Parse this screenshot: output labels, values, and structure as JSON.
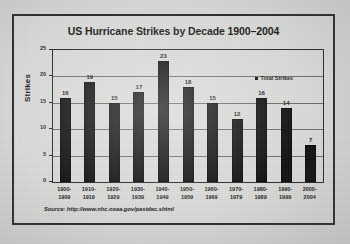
{
  "chart_data": {
    "type": "bar",
    "title": "US Hurricane Strikes by Decade 1900–2004",
    "xlabel": "",
    "ylabel": "Strikes",
    "ylim": [
      0,
      25
    ],
    "ytick_step": 5,
    "grid": true,
    "legend_position": "top-right",
    "legend": [
      "Total Strikes"
    ],
    "categories": [
      "1900–\n1909",
      "1910–\n1919",
      "1920–\n1929",
      "1930–\n1939",
      "1940–\n1949",
      "1950–\n1959",
      "1960–\n1969",
      "1970–\n1979",
      "1980–\n1989",
      "1990–\n1999",
      "2000–\n2004"
    ],
    "category_lines": [
      [
        "1900-",
        "1909"
      ],
      [
        "1910-",
        "1919"
      ],
      [
        "1920-",
        "1929"
      ],
      [
        "1930-",
        "1939"
      ],
      [
        "1940-",
        "1949"
      ],
      [
        "1950-",
        "1959"
      ],
      [
        "1960-",
        "1969"
      ],
      [
        "1970-",
        "1979"
      ],
      [
        "1980-",
        "1989"
      ],
      [
        "1990-",
        "1999"
      ],
      [
        "2000-",
        "2004"
      ]
    ],
    "values": [
      16,
      19,
      15,
      17,
      23,
      18,
      15,
      12,
      16,
      14,
      7
    ],
    "ytick_labels": [
      "0",
      "5",
      "10",
      "15",
      "20",
      "25"
    ],
    "series": [
      {
        "name": "Total Strikes",
        "values": [
          16,
          19,
          15,
          17,
          23,
          18,
          15,
          12,
          16,
          14,
          7
        ],
        "color": "#111111"
      }
    ],
    "source": "Source: http://www.nhc.noaa.gov/pastdec.shtml"
  },
  "colors": {
    "page_background": "#d8d8d6",
    "frame_border": "#2c2c2c",
    "bar": "#111111",
    "grid": "#6e6e6c",
    "text": "#1a1a1a"
  }
}
